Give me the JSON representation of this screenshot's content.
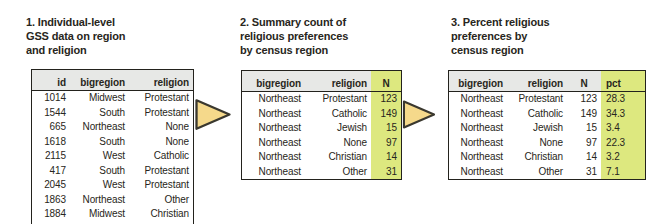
{
  "figure": {
    "panels": [
      {
        "id": "individual-data",
        "title_lines": [
          "1. Individual-level",
          "GSS data on region",
          "and religion"
        ],
        "columns": [
          "id",
          "bigregion",
          "religion"
        ],
        "highlight_col": null,
        "rows": [
          [
            "1014",
            "Midwest",
            "Protestant"
          ],
          [
            "1544",
            "South",
            "Protestant"
          ],
          [
            "665",
            "Northeast",
            "None"
          ],
          [
            "1618",
            "South",
            "None"
          ],
          [
            "2115",
            "West",
            "Catholic"
          ],
          [
            "417",
            "South",
            "Protestant"
          ],
          [
            "2045",
            "West",
            "Protestant"
          ],
          [
            "1863",
            "Northeast",
            "Other"
          ],
          [
            "1884",
            "Midwest",
            "Christian"
          ],
          [
            "1628",
            "South",
            "Protestant"
          ]
        ]
      },
      {
        "id": "summary-count",
        "title_lines": [
          "2. Summary count of",
          "religious preferences",
          "by census region"
        ],
        "columns": [
          "bigregion",
          "religion",
          "N"
        ],
        "highlight_col": "N",
        "rows": [
          [
            "Northeast",
            "Protestant",
            "123"
          ],
          [
            "Northeast",
            "Catholic",
            "149"
          ],
          [
            "Northeast",
            "Jewish",
            "15"
          ],
          [
            "Northeast",
            "None",
            "97"
          ],
          [
            "Northeast",
            "Christian",
            "14"
          ],
          [
            "Northeast",
            "Other",
            "31"
          ]
        ]
      },
      {
        "id": "percent",
        "title_lines": [
          "3. Percent religious",
          "preferences by",
          "census region"
        ],
        "columns": [
          "bigregion",
          "religion",
          "N",
          "pct"
        ],
        "highlight_col": "pct",
        "rows": [
          [
            "Northeast",
            "Protestant",
            "123",
            "28.3"
          ],
          [
            "Northeast",
            "Catholic",
            "149",
            "34.3"
          ],
          [
            "Northeast",
            "Jewish",
            "15",
            "3.4"
          ],
          [
            "Northeast",
            "None",
            "97",
            "22.3"
          ],
          [
            "Northeast",
            "Christian",
            "14",
            "3.2"
          ],
          [
            "Northeast",
            "Other",
            "31",
            "7.1"
          ]
        ]
      }
    ],
    "colors": {
      "highlight_green": "#dde87f",
      "header_gray": "#e7e8e6",
      "arrow_fill": "#f5d98b",
      "arrow_outline": "#3a382f",
      "table_border": "#23221d",
      "text": "#282620"
    }
  }
}
